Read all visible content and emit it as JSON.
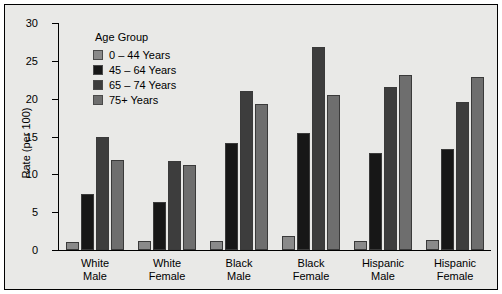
{
  "chart_data": {
    "type": "bar",
    "title": "",
    "xlabel": "",
    "ylabel": "Rate (per 100)",
    "ylim": [
      0,
      30
    ],
    "yticks": [
      0,
      5,
      10,
      15,
      20,
      25,
      30
    ],
    "ytick_labels": [
      "0",
      "5",
      "10",
      "15",
      "20",
      "25",
      "30"
    ],
    "grid": false,
    "legend_position": "upper-left-inside",
    "legend_title": "Age Group",
    "categories": [
      "White\nMale",
      "White\nFemale",
      "Black\nMale",
      "Black\nFemale",
      "Hispanic\nMale",
      "Hispanic\nFemale"
    ],
    "series": [
      {
        "name": "0 – 44 Years",
        "color": "#8a8a8a",
        "values": [
          1.1,
          1.2,
          1.2,
          1.8,
          1.2,
          1.3
        ]
      },
      {
        "name": "45 – 64 Years",
        "color": "#171717",
        "values": [
          7.4,
          6.3,
          14.1,
          15.5,
          12.8,
          13.3
        ]
      },
      {
        "name": "65 – 74 Years",
        "color": "#3d3d3d",
        "values": [
          14.9,
          11.7,
          21.0,
          26.8,
          21.5,
          19.6
        ]
      },
      {
        "name": "75+ Years",
        "color": "#6e6e6e",
        "values": [
          11.9,
          11.3,
          19.3,
          20.5,
          23.1,
          22.8
        ]
      }
    ]
  },
  "figure": {
    "background_color": "#e9e9e7",
    "border_color": "#000000",
    "axis_color": "#000000"
  }
}
